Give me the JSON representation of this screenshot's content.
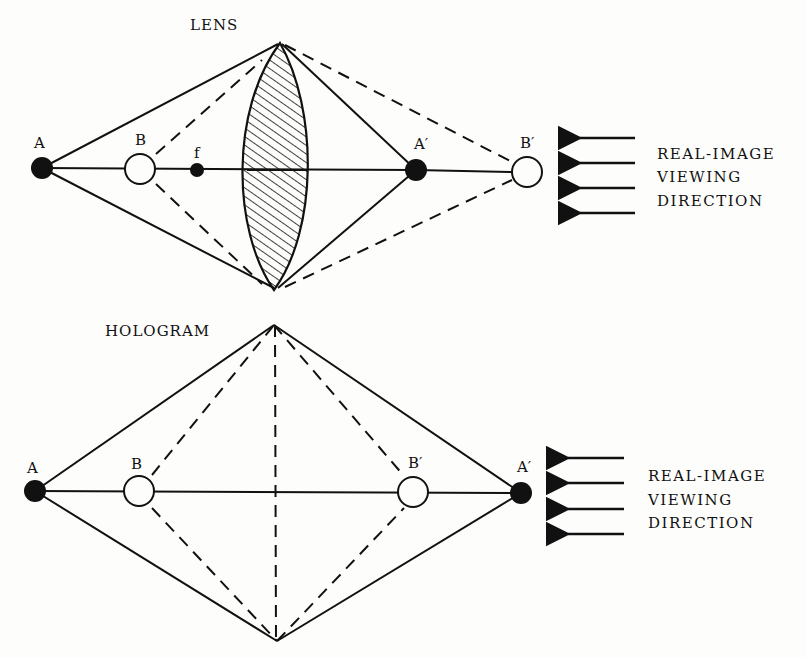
{
  "lens_panel": {
    "title": "LENS",
    "points": {
      "A": "A",
      "B": "B",
      "f": "f",
      "A_prime": "A′",
      "B_prime": "B′"
    },
    "direction_label": [
      "REAL-IMAGE",
      "VIEWING",
      "DIRECTION"
    ],
    "arrow_count": 4
  },
  "hologram_panel": {
    "title": "HOLOGRAM",
    "points": {
      "A": "A",
      "B": "B",
      "B_prime": "B′",
      "A_prime": "A′"
    },
    "direction_label": [
      "REAL-IMAGE",
      "VIEWING",
      "DIRECTION"
    ],
    "arrow_count": 4
  },
  "colors": {
    "ink": "#111111",
    "paper": "#fdfdfc"
  }
}
